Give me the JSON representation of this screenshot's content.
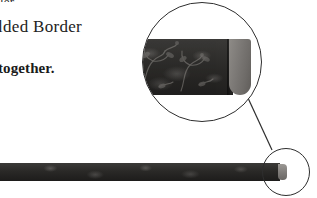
{
  "page": {
    "background_color": "#ffffff",
    "width": 317,
    "height": 198
  },
  "text": {
    "clipped_top_line": "ler.",
    "heading": "lded Border",
    "body": "together."
  },
  "figure": {
    "strip": {
      "name": "molded-border-strip",
      "body_color": "#2a2927",
      "cap_color": "#7e7b78",
      "pattern": "damask-floral-embossed"
    },
    "callout_small": {
      "name": "detail-marker-circle",
      "stroke_color": "#2e2e2e"
    },
    "callout_large": {
      "name": "magnified-detail-circle",
      "stroke_color": "#2e2e2e",
      "shows": "molded border end with rounded folded cap"
    },
    "leader_line": {
      "name": "callout-leader-line",
      "stroke_color": "#2e2e2e"
    }
  }
}
